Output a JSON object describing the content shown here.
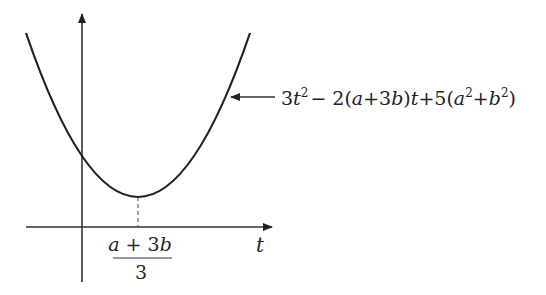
{
  "diagram": {
    "type": "parabola-graph",
    "axes": {
      "horizontal_label": "t",
      "vertical_label": ""
    },
    "curve": {
      "expression": "3t² − 2(a+3b)t + 5(a²+b²)",
      "label_parts": {
        "p1": "3",
        "t": "t",
        "sq": "2",
        "p2": "− 2(",
        "a": "a",
        "p3": "+3",
        "b": "b",
        "p4": ")",
        "p5": "+5(",
        "a2": "a",
        "p6": "+",
        "b2": "b",
        "p7": ")"
      }
    },
    "vertex_label": {
      "numerator_a": "a",
      "numerator_rest": " + 3",
      "numerator_b": "b",
      "denominator": "3"
    }
  }
}
